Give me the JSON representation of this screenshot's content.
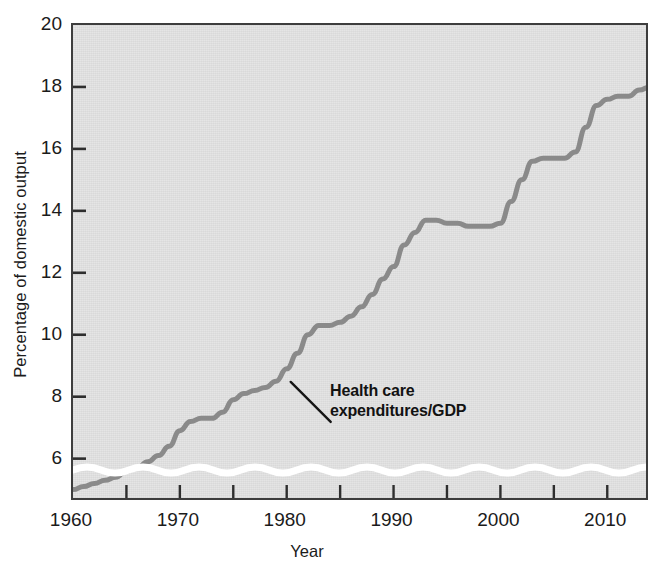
{
  "chart_data": {
    "type": "line",
    "title": "",
    "xlabel": "Year",
    "ylabel": "Percentage of domestic output",
    "xlim": [
      1960,
      2014
    ],
    "ylim": [
      4.6,
      20
    ],
    "grid": false,
    "legend_position": "none",
    "y_axis_broken": true,
    "y_break_note": "wavy white break band just above the x-axis indicating the vertical scale does not start at zero",
    "y_ticks": [
      6,
      8,
      10,
      12,
      14,
      16,
      18,
      20
    ],
    "y_tick_labels": [
      "6",
      "8",
      "10",
      "12",
      "14",
      "16",
      "18",
      "20"
    ],
    "x_ticks": [
      1960,
      1965,
      1970,
      1975,
      1980,
      1985,
      1990,
      1995,
      2000,
      2005,
      2010
    ],
    "x_tick_labels_shown": [
      "1960",
      "1970",
      "1980",
      "1990",
      "2000",
      "2010"
    ],
    "x_labelled_ticks": [
      1960,
      1970,
      1980,
      1990,
      2000,
      2010
    ],
    "series": [
      {
        "name": "Health care expenditures/GDP",
        "color": "#8a8a8a",
        "x": [
          1960,
          1961,
          1962,
          1963,
          1964,
          1965,
          1966,
          1967,
          1968,
          1969,
          1970,
          1971,
          1972,
          1973,
          1974,
          1975,
          1976,
          1977,
          1978,
          1979,
          1980,
          1981,
          1982,
          1983,
          1984,
          1985,
          1986,
          1987,
          1988,
          1989,
          1990,
          1991,
          1992,
          1993,
          1994,
          1995,
          1996,
          1997,
          1998,
          1999,
          2000,
          2001,
          2002,
          2003,
          2004,
          2005,
          2006,
          2007,
          2008,
          2009,
          2010,
          2011,
          2012,
          2013,
          2014
        ],
        "values": [
          5.0,
          5.1,
          5.2,
          5.3,
          5.4,
          5.6,
          5.7,
          5.9,
          6.1,
          6.4,
          6.9,
          7.2,
          7.3,
          7.3,
          7.5,
          7.9,
          8.1,
          8.2,
          8.3,
          8.5,
          8.9,
          9.4,
          10.0,
          10.3,
          10.3,
          10.4,
          10.6,
          10.9,
          11.3,
          11.8,
          12.2,
          12.9,
          13.3,
          13.7,
          13.7,
          13.6,
          13.6,
          13.5,
          13.5,
          13.5,
          13.6,
          14.3,
          15.0,
          15.6,
          15.7,
          15.7,
          15.7,
          15.9,
          16.7,
          17.4,
          17.6,
          17.7,
          17.7,
          17.9,
          18.0
        ]
      }
    ],
    "annotations": [
      {
        "name": "series-label",
        "text_line_1": "Health care",
        "text_line_2": "expenditures/GDP",
        "points_to_year": 1980,
        "points_to_value": 8.8
      }
    ],
    "style": {
      "plot_background": "#e4e4e4",
      "plot_border": "#3d3d3d",
      "line_color": "#8a8a8a",
      "line_width_px": 5,
      "text_color": "#1b1b1b",
      "axis_break_color": "#ffffff"
    }
  },
  "axes": {
    "y_title": "Percentage of domestic output",
    "x_title": "Year"
  }
}
